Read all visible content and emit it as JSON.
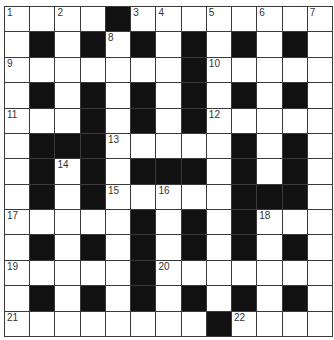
{
  "puzzle": {
    "type": "crossword",
    "rows": 13,
    "cols": 13,
    "colors": {
      "black_cell": "#111111",
      "white_cell": "#ffffff",
      "grid_line": "#3a3a3a",
      "number_text": "#333333"
    },
    "grid": [
      "....#........",
      ".#.#.#.#.#.#.",
      ".......#.....",
      ".#.#.#.#.#.#.",
      "...#.#.#.....",
      ".###.....#.#.",
      ".#.#.###.#.#.",
      ".#.#.....###.",
      ".....#.#.#...",
      ".#.#.#.#.#.#.",
      ".....#.......",
      ".#.#.#.#.#.#.",
      "........#...."
    ],
    "numbers": [
      {
        "row": 0,
        "col": 0,
        "n": "1"
      },
      {
        "row": 0,
        "col": 2,
        "n": "2"
      },
      {
        "row": 0,
        "col": 5,
        "n": "3"
      },
      {
        "row": 0,
        "col": 6,
        "n": "4"
      },
      {
        "row": 0,
        "col": 8,
        "n": "5"
      },
      {
        "row": 0,
        "col": 10,
        "n": "6"
      },
      {
        "row": 0,
        "col": 12,
        "n": "7"
      },
      {
        "row": 1,
        "col": 4,
        "n": "8"
      },
      {
        "row": 2,
        "col": 0,
        "n": "9"
      },
      {
        "row": 2,
        "col": 8,
        "n": "10"
      },
      {
        "row": 4,
        "col": 0,
        "n": "11"
      },
      {
        "row": 4,
        "col": 8,
        "n": "12"
      },
      {
        "row": 5,
        "col": 4,
        "n": "13"
      },
      {
        "row": 6,
        "col": 2,
        "n": "14"
      },
      {
        "row": 7,
        "col": 4,
        "n": "15"
      },
      {
        "row": 7,
        "col": 6,
        "n": "16"
      },
      {
        "row": 8,
        "col": 0,
        "n": "17"
      },
      {
        "row": 8,
        "col": 10,
        "n": "18"
      },
      {
        "row": 10,
        "col": 0,
        "n": "19"
      },
      {
        "row": 10,
        "col": 6,
        "n": "20"
      },
      {
        "row": 12,
        "col": 0,
        "n": "21"
      },
      {
        "row": 12,
        "col": 9,
        "n": "22"
      }
    ]
  }
}
